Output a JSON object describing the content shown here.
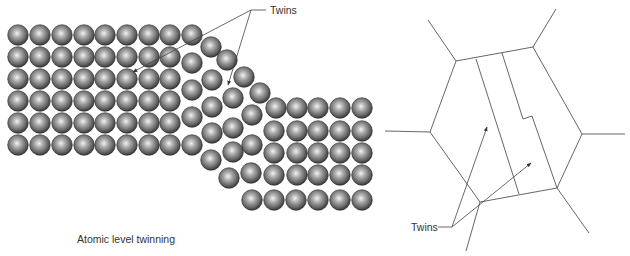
{
  "figure": {
    "left_panel": {
      "caption": "Atomic level twinning",
      "callout_label": "Twins",
      "atom_radius": 10.3,
      "atoms": [
        [
          18,
          35
        ],
        [
          40,
          35
        ],
        [
          62,
          35
        ],
        [
          84,
          35
        ],
        [
          105,
          35
        ],
        [
          127,
          35
        ],
        [
          149,
          35
        ],
        [
          170,
          35
        ],
        [
          192,
          35
        ],
        [
          18,
          57
        ],
        [
          40,
          57
        ],
        [
          62,
          57
        ],
        [
          84,
          57
        ],
        [
          105,
          57
        ],
        [
          127,
          57
        ],
        [
          149,
          57
        ],
        [
          170,
          57
        ],
        [
          18,
          79
        ],
        [
          40,
          79
        ],
        [
          62,
          79
        ],
        [
          84,
          79
        ],
        [
          105,
          79
        ],
        [
          127,
          79
        ],
        [
          149,
          79
        ],
        [
          170,
          79
        ],
        [
          18,
          101
        ],
        [
          40,
          101
        ],
        [
          62,
          101
        ],
        [
          84,
          101
        ],
        [
          105,
          101
        ],
        [
          127,
          101
        ],
        [
          149,
          101
        ],
        [
          170,
          101
        ],
        [
          18,
          123
        ],
        [
          40,
          123
        ],
        [
          62,
          123
        ],
        [
          84,
          123
        ],
        [
          105,
          123
        ],
        [
          127,
          123
        ],
        [
          149,
          123
        ],
        [
          170,
          123
        ],
        [
          18,
          145
        ],
        [
          40,
          145
        ],
        [
          62,
          145
        ],
        [
          84,
          145
        ],
        [
          105,
          145
        ],
        [
          127,
          145
        ],
        [
          149,
          145
        ],
        [
          170,
          145
        ],
        [
          211,
          47
        ],
        [
          227,
          60
        ],
        [
          244,
          77
        ],
        [
          260,
          93
        ],
        [
          192,
          63
        ],
        [
          212,
          80
        ],
        [
          233,
          98
        ],
        [
          252,
          115
        ],
        [
          192,
          90
        ],
        [
          212,
          107
        ],
        [
          233,
          128
        ],
        [
          252,
          145
        ],
        [
          192,
          117
        ],
        [
          212,
          133
        ],
        [
          233,
          152
        ],
        [
          192,
          145
        ],
        [
          211,
          160
        ],
        [
          229,
          178
        ],
        [
          251,
          173
        ],
        [
          276,
          108
        ],
        [
          297,
          108
        ],
        [
          318,
          108
        ],
        [
          340,
          108
        ],
        [
          362,
          108
        ],
        [
          274,
          131
        ],
        [
          297,
          131
        ],
        [
          318,
          131
        ],
        [
          340,
          131
        ],
        [
          362,
          131
        ],
        [
          274,
          153
        ],
        [
          297,
          153
        ],
        [
          318,
          153
        ],
        [
          340,
          153
        ],
        [
          362,
          153
        ],
        [
          274,
          175
        ],
        [
          297,
          175
        ],
        [
          318,
          175
        ],
        [
          340,
          175
        ],
        [
          362,
          175
        ],
        [
          252,
          200
        ],
        [
          274,
          200
        ],
        [
          296,
          200
        ],
        [
          318,
          200
        ],
        [
          340,
          200
        ],
        [
          362,
          200
        ]
      ],
      "callout": {
        "joint": [
          251,
          10
        ],
        "label_line_end": [
          266,
          10
        ],
        "label_pos": [
          270,
          14
        ],
        "arrow_tips": [
          [
            133,
            72
          ],
          [
            228,
            85
          ]
        ]
      },
      "caption_pos": [
        77,
        243
      ]
    },
    "right_panel": {
      "callout_label": "Twins",
      "grain_vertices": [
        [
          456,
          61
        ],
        [
          533,
          47
        ],
        [
          582,
          134
        ],
        [
          557,
          188
        ],
        [
          480,
          202
        ],
        [
          430,
          132
        ]
      ],
      "spokes": [
        [
          [
            456,
            61
          ],
          [
            428,
            20
          ]
        ],
        [
          [
            533,
            47
          ],
          [
            556,
            9
          ]
        ],
        [
          [
            582,
            134
          ],
          [
            625,
            134
          ]
        ],
        [
          [
            557,
            188
          ],
          [
            589,
            233
          ]
        ],
        [
          [
            480,
            202
          ],
          [
            466,
            251
          ]
        ],
        [
          [
            430,
            132
          ],
          [
            385,
            131
          ]
        ]
      ],
      "twin_boundaries": [
        [
          [
            476,
            59
          ],
          [
            519,
            194
          ]
        ],
        [
          [
            502,
            53
          ],
          [
            523,
            119
          ],
          [
            532,
            116
          ],
          [
            557,
            188
          ]
        ]
      ],
      "callout": {
        "joint": [
          452,
          227
        ],
        "label_line_start": [
          438,
          227
        ],
        "label_pos": [
          411,
          231
        ],
        "arrow_tips": [
          [
            487,
            127
          ],
          [
            531,
            163
          ]
        ]
      }
    }
  }
}
